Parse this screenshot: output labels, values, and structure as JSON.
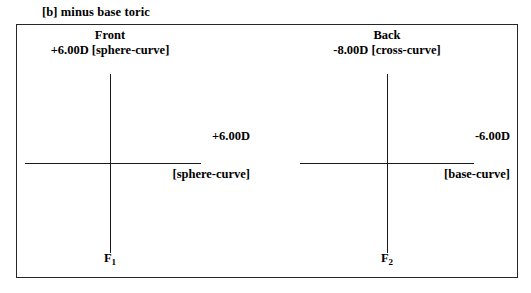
{
  "figure": {
    "caption": "[b] minus base toric"
  },
  "surfaces": [
    {
      "name": "front",
      "title": "Front",
      "power": "+6.00D [sphere-curve]",
      "axis_label": "F",
      "axis_subscript": "1",
      "meridian_power": "+6.00D",
      "meridian_type": "[sphere-curve]"
    },
    {
      "name": "back",
      "title": "Back",
      "power": "-8.00D [cross-curve]",
      "axis_label": "F",
      "axis_subscript": "2",
      "meridian_power": "-6.00D",
      "meridian_type": "[base-curve]"
    }
  ],
  "colors": {
    "stroke": "#1a1a1a",
    "frame": "#262626",
    "text": "#000000",
    "background": "#ffffff"
  }
}
